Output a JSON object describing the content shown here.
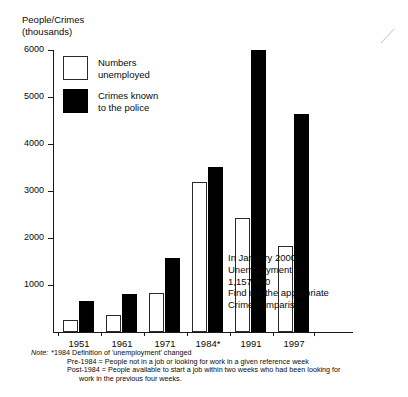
{
  "chart_data": {
    "type": "bar",
    "title": "",
    "ylabel": "People/Crimes\n(thousands)",
    "xlabel": "",
    "categories": [
      "1951",
      "1961",
      "1971",
      "1984*",
      "1991",
      "1997"
    ],
    "series": [
      {
        "name": "Numbers unemployed",
        "color": "#ffffff",
        "values": [
          250,
          370,
          820,
          3200,
          2420,
          1830
        ]
      },
      {
        "name": "Crimes known to the police",
        "color": "#000000",
        "values": [
          650,
          800,
          1580,
          3520,
          6000,
          4630
        ]
      }
    ],
    "ylim": [
      0,
      6000
    ],
    "yticks": [
      1000,
      2000,
      3000,
      4000,
      5000,
      6000
    ],
    "ytick_labels": [
      "1000",
      "2000",
      "3000",
      "4000",
      "5000",
      "6000"
    ],
    "grid": false,
    "legend_position": "inside-top-left"
  },
  "legend": {
    "items": [
      {
        "label": "Numbers\nunemployed",
        "swatch": "open"
      },
      {
        "label": "Crimes known\nto the police",
        "swatch": "filled"
      }
    ]
  },
  "annotation": {
    "text": "In January 2000\nUnemployment =\n1,157,900\nFind out the appropriate\nCrime comparison"
  },
  "footnote": {
    "note_label": "Note:",
    "line1": "*1984 Definition of 'unemployment' changed",
    "line2": "Pre-1984 = People not in a job or looking for work in a given reference week",
    "line3": "Post-1984 = People available to start a job within two weeks who had been looking for",
    "line4": "work in the previous four weeks."
  }
}
